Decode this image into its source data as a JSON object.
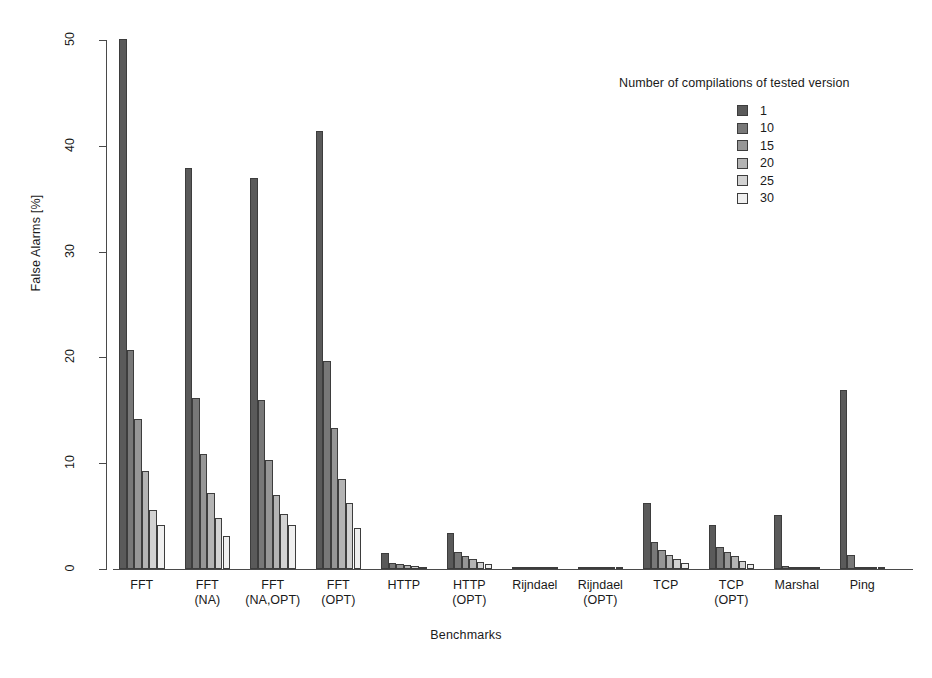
{
  "chart_data": {
    "type": "bar",
    "title": "",
    "xlabel": "Benchmarks",
    "ylabel": "False Alarms [%]",
    "ylim": [
      0,
      50
    ],
    "yticks": [
      0,
      10,
      20,
      30,
      40,
      50
    ],
    "grid": false,
    "legend_position": "top-right",
    "legend_title": "Number of compilations of tested version",
    "categories": [
      "FFT",
      "FFT (NA)",
      "FFT (NA,OPT)",
      "FFT (OPT)",
      "HTTP",
      "HTTP (OPT)",
      "Rijndael",
      "Rijndael (OPT)",
      "TCP",
      "TCP (OPT)",
      "Marshal",
      "Ping"
    ],
    "category_lines": [
      [
        "FFT",
        ""
      ],
      [
        "FFT",
        "(NA)"
      ],
      [
        "FFT",
        "(NA,OPT)"
      ],
      [
        "FFT",
        "(OPT)"
      ],
      [
        "HTTP",
        ""
      ],
      [
        "HTTP",
        "(OPT)"
      ],
      [
        "Rijndael",
        ""
      ],
      [
        "Rijndael",
        "(OPT)"
      ],
      [
        "TCP",
        ""
      ],
      [
        "TCP",
        "(OPT)"
      ],
      [
        "Marshal",
        ""
      ],
      [
        "Ping",
        ""
      ]
    ],
    "series": [
      {
        "name": "1",
        "color": "#5a5a5a",
        "values": [
          50.1,
          37.9,
          37.0,
          41.4,
          1.5,
          3.4,
          0.05,
          0.05,
          6.2,
          4.2,
          5.1,
          16.9
        ]
      },
      {
        "name": "10",
        "color": "#787878",
        "values": [
          20.7,
          16.2,
          16.0,
          19.7,
          0.6,
          1.6,
          0.03,
          0.03,
          2.6,
          2.1,
          0.3,
          1.3
        ]
      },
      {
        "name": "15",
        "color": "#969696",
        "values": [
          14.2,
          10.9,
          10.3,
          13.3,
          0.45,
          1.2,
          0.02,
          0.02,
          1.8,
          1.6,
          0.2,
          0.2
        ]
      },
      {
        "name": "20",
        "color": "#b4b4b4",
        "values": [
          9.3,
          7.2,
          7.0,
          8.5,
          0.35,
          0.9,
          0.02,
          0.02,
          1.3,
          1.2,
          0.15,
          0.12
        ]
      },
      {
        "name": "25",
        "color": "#d2d2d2",
        "values": [
          5.6,
          4.8,
          5.2,
          6.2,
          0.25,
          0.7,
          0.01,
          0.01,
          0.9,
          0.8,
          0.1,
          0.08
        ]
      },
      {
        "name": "30",
        "color": "#efefef",
        "values": [
          4.2,
          3.1,
          4.2,
          3.9,
          0.18,
          0.5,
          0.01,
          0.01,
          0.6,
          0.5,
          0.08,
          0.05
        ]
      }
    ]
  },
  "legend": {
    "title": "Number of compilations of tested version",
    "entries": [
      "1",
      "10",
      "15",
      "20",
      "25",
      "30"
    ]
  },
  "axes": {
    "y_label": "False Alarms [%]",
    "x_label": "Benchmarks",
    "y_ticks": [
      "0",
      "10",
      "20",
      "30",
      "40",
      "50"
    ]
  }
}
